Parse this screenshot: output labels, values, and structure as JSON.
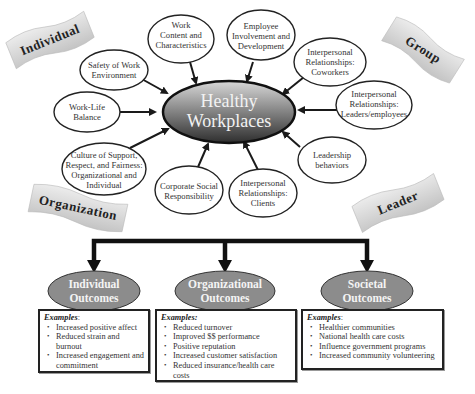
{
  "center": {
    "line1": "Healthy",
    "line2": "Workplaces"
  },
  "banners": {
    "individual": "Individual",
    "group": "Group",
    "organization": "Organization",
    "leader": "Leader"
  },
  "factors": [
    {
      "id": "safety",
      "lines": [
        "Safety of Work",
        "Environment"
      ]
    },
    {
      "id": "work-content",
      "lines": [
        "Work",
        "Content and",
        "Characteristics"
      ]
    },
    {
      "id": "employee-involvement",
      "lines": [
        "Employee",
        "Involvement and",
        "Development"
      ]
    },
    {
      "id": "coworkers",
      "lines": [
        "Interpersonal",
        "Relationships:",
        "Coworkers"
      ]
    },
    {
      "id": "leaders-employees",
      "lines": [
        "Interpersonal",
        "Relationships:",
        "Leaders/employees"
      ]
    },
    {
      "id": "leadership-behaviors",
      "lines": [
        "Leadership",
        "behaviors"
      ]
    },
    {
      "id": "clients",
      "lines": [
        "Interpersonal",
        "Relationships:",
        "Clients"
      ]
    },
    {
      "id": "csr",
      "lines": [
        "Corporate Social",
        "Responsibility"
      ]
    },
    {
      "id": "culture",
      "lines": [
        "Culture of Support,",
        "Respect, and Fairness:",
        "Organizational and",
        "Individual"
      ]
    },
    {
      "id": "work-life",
      "lines": [
        "Work-Life",
        "Balance"
      ]
    }
  ],
  "outcomes": [
    {
      "id": "individual",
      "title_line1": "Individual",
      "title_line2": "Outcomes",
      "examples_label": "Examples",
      "examples_suffix": ":",
      "items": [
        "Increased positive affect",
        "Reduced strain and burnout",
        "Increased engagement and commitment"
      ]
    },
    {
      "id": "organizational",
      "title_line1": "Organizational",
      "title_line2": "Outcomes",
      "examples_label": "Examples:",
      "examples_suffix": "",
      "items": [
        "Reduced turnover",
        "Improved $$ performance",
        "Positive reputation",
        "Increased customer satisfaction",
        "Reduced insurance/health care costs"
      ]
    },
    {
      "id": "societal",
      "title_line1": "Societal",
      "title_line2": "Outcomes",
      "examples_label": "Examples",
      "examples_suffix": ":",
      "items": [
        "Healthier communities",
        "National health care costs",
        "Influence government programs",
        "Increased community volunteering"
      ]
    }
  ],
  "colors": {
    "center_dark": "#3a3a3a",
    "center_light": "#d9d9d9",
    "outcome_fill": "#8c8c8c",
    "banner_fill": "#d6d6d6",
    "stroke": "#1a1a1a"
  }
}
